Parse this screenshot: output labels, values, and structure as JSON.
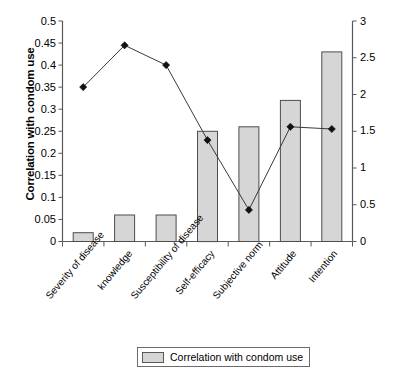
{
  "chart_data": {
    "type": "bar",
    "title": "",
    "subtitle": "",
    "xlabel": "",
    "ylabel": "Correlation with condom use",
    "y2label": "Messages in leaflets",
    "ylim": [
      0,
      0.5
    ],
    "y2lim": [
      0,
      3
    ],
    "grid": false,
    "legend_position": "bottom-center",
    "categories": [
      "Severity of disease",
      "knowledge",
      "Susceptibility of disease",
      "Self-efficacy",
      "Subjective norm",
      "Attitude",
      "Intention"
    ],
    "left_ticks": [
      "0",
      "0.05",
      "0.1",
      "0.15",
      "0.2",
      "0.25",
      "0.3",
      "0.35",
      "0.4",
      "0.45",
      "0.5"
    ],
    "left_tick_values": [
      0,
      0.05,
      0.1,
      0.15,
      0.2,
      0.25,
      0.3,
      0.35,
      0.4,
      0.45,
      0.5
    ],
    "right_ticks": [
      "0",
      "0.5",
      "1",
      "1.5",
      "2",
      "2.5",
      "3"
    ],
    "right_tick_values": [
      0,
      0.5,
      1,
      1.5,
      2,
      2.5,
      3
    ],
    "series": [
      {
        "name": "Correlation with condom use",
        "type": "bar",
        "axis": "left",
        "values": [
          0.02,
          0.06,
          0.06,
          0.25,
          0.26,
          0.32,
          0.43
        ],
        "fill": "#d6d6d6",
        "stroke": "#4d4d4d"
      },
      {
        "name": "Messages in leaflets",
        "type": "line",
        "axis": "right",
        "values": [
          2.1,
          2.67,
          2.4,
          1.38,
          0.43,
          1.56,
          1.53
        ],
        "marker": "diamond",
        "stroke": "#3a3a3a",
        "marker_fill": "#111111"
      }
    ]
  },
  "legend": {
    "items": [
      {
        "label": "Correlation with condom use",
        "swatch_color": "#d6d6d6"
      }
    ]
  },
  "colors": {
    "bar_fill": "#d6d6d6",
    "bar_stroke": "#4d4d4d",
    "line": "#3a3a3a",
    "marker": "#111111",
    "axis": "#595959",
    "text": "#000000",
    "background": "#ffffff"
  }
}
